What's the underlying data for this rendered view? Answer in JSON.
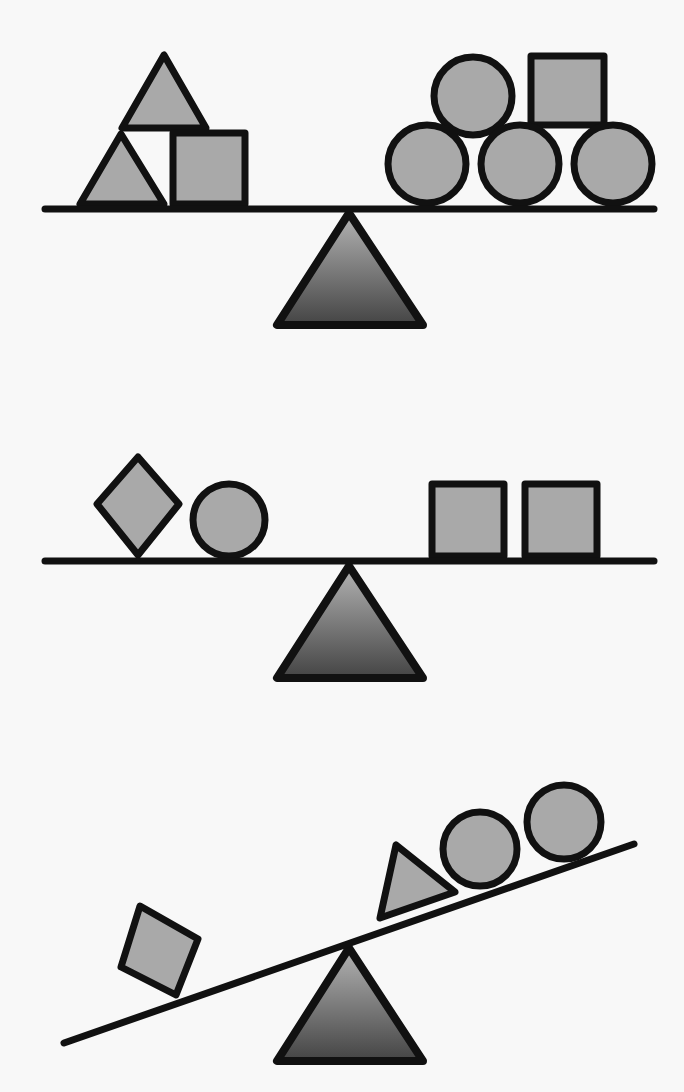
{
  "title": "Balance scale puzzle",
  "colors": {
    "background": "#f8f8f8",
    "outline": "#111111",
    "shape_fill": "#a9a9a9",
    "fulcrum_top": "#b4b4b4",
    "fulcrum_bottom": "#444444"
  },
  "scales": [
    {
      "label": "Scale 1",
      "state": "balanced",
      "left_pan": [
        "triangle",
        "triangle",
        "square"
      ],
      "right_pan": [
        "circle",
        "circle",
        "circle",
        "circle",
        "square"
      ]
    },
    {
      "label": "Scale 2",
      "state": "balanced",
      "left_pan": [
        "diamond",
        "circle"
      ],
      "right_pan": [
        "square",
        "square"
      ]
    },
    {
      "label": "Scale 3",
      "state": "tilted-left-down",
      "left_pan": [
        "diamond"
      ],
      "right_pan": [
        "triangle",
        "circle",
        "circle"
      ]
    }
  ]
}
